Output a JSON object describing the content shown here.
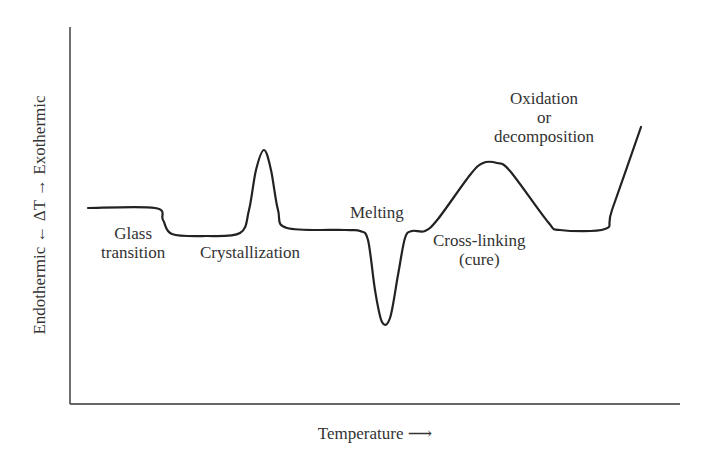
{
  "chart_data": {
    "type": "line",
    "title": "",
    "xlabel": "Temperature ⟶",
    "ylabel": "Endothermic ← ΔT → Exothermic",
    "grid": false,
    "legend": null,
    "axis_ticks": false,
    "annotations": [
      {
        "text": "Glass\ntransition",
        "line1": "Glass",
        "line2": "transition",
        "feature": "step-down"
      },
      {
        "text": "Crystallization",
        "feature": "exothermic peak"
      },
      {
        "text": "Melting",
        "feature": "endothermic trough"
      },
      {
        "text": "Cross-linking\n(cure)",
        "line1": "Cross-linking",
        "line2": "(cure)",
        "feature": "broad exothermic hump"
      },
      {
        "text": "Oxidation\nor\ndecomposition",
        "line1": "Oxidation",
        "line2": "or",
        "line3": "decomposition",
        "feature": "steep rise"
      }
    ],
    "series": [
      {
        "name": "DSC curve",
        "points_px": [
          [
            88,
            208
          ],
          [
            155,
            208
          ],
          [
            163,
            220
          ],
          [
            172,
            234
          ],
          [
            205,
            236
          ],
          [
            240,
            233
          ],
          [
            249,
            210
          ],
          [
            256,
            170
          ],
          [
            264,
            150
          ],
          [
            271,
            170
          ],
          [
            278,
            210
          ],
          [
            287,
            228
          ],
          [
            345,
            230
          ],
          [
            360,
            231
          ],
          [
            368,
            240
          ],
          [
            375,
            290
          ],
          [
            382,
            322
          ],
          [
            390,
            318
          ],
          [
            398,
            275
          ],
          [
            405,
            238
          ],
          [
            412,
            231
          ],
          [
            425,
            231
          ],
          [
            438,
            219
          ],
          [
            470,
            175
          ],
          [
            483,
            163
          ],
          [
            497,
            163
          ],
          [
            510,
            171
          ],
          [
            548,
            222
          ],
          [
            560,
            230
          ],
          [
            605,
            229
          ],
          [
            612,
            210
          ],
          [
            641,
            127
          ]
        ]
      }
    ]
  },
  "labels": {
    "y_axis": "Endothermic ← ΔT → Exothermic",
    "x_axis": "Temperature ⟶",
    "glass_1": "Glass",
    "glass_2": "transition",
    "cryst": "Crystallization",
    "melt": "Melting",
    "cross_1": "Cross-linking",
    "cross_2": "(cure)",
    "ox_1": "Oxidation",
    "ox_2": "or",
    "ox_3": "decomposition"
  }
}
